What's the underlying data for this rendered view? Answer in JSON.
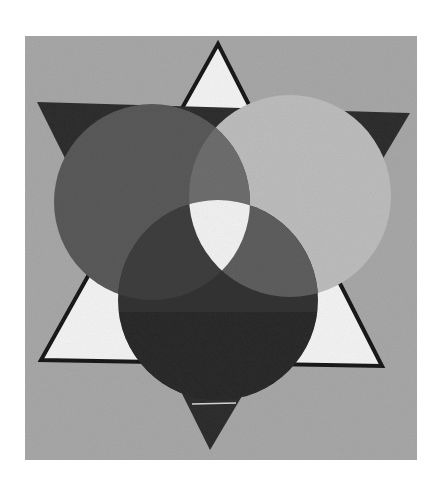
{
  "image": {
    "description": "Grayscale photograph of a painting: a six-pointed star with three overlapping circles",
    "alt": "Painting of a six-pointed star with three overlapping circles"
  },
  "colors": {
    "page_background": "#ffffff",
    "canvas": "#a8a8a8",
    "star_up_fill": "#f4f4f4",
    "star_down_fill": "#2e2e2e",
    "star_outline": "#1a1a1a",
    "circle_left": "#5a5a5a",
    "circle_right": "#bdbdbd",
    "circle_bottom": "#333333",
    "overlap_left_right": "#6e6e6e",
    "overlap_left_bottom": "#3f3f3f",
    "overlap_right_bottom": "#5e5e5e",
    "center_overlap": "#f2f2f2"
  }
}
